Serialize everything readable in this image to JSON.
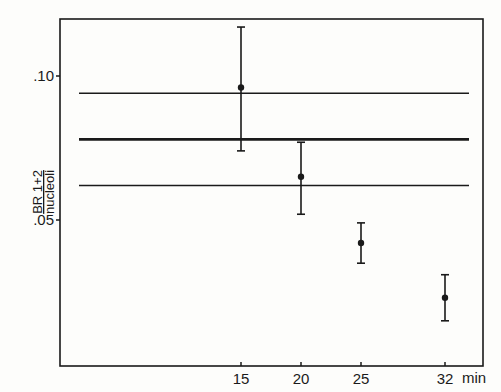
{
  "chart_data": {
    "type": "scatter",
    "title": "",
    "xlabel": "min",
    "ylabel": "BR 1+2 / nucleoli",
    "ylabel_numerator": "BR 1+2",
    "ylabel_denominator": "nucleoli",
    "xlim": [
      0,
      35
    ],
    "ylim": [
      0,
      0.12
    ],
    "grid": false,
    "legend": null,
    "x_ticks": [
      15,
      20,
      25,
      32
    ],
    "x_tick_labels": [
      "15",
      "20",
      "25",
      "32"
    ],
    "y_ticks": [
      0.05,
      0.1
    ],
    "y_tick_labels": [
      ".05",
      ".10"
    ],
    "series": [
      {
        "name": "mean ± error",
        "points": [
          {
            "x": 15,
            "y": 0.096,
            "y_low": 0.074,
            "y_high": 0.117
          },
          {
            "x": 20,
            "y": 0.065,
            "y_low": 0.052,
            "y_high": 0.077
          },
          {
            "x": 25,
            "y": 0.042,
            "y_low": 0.035,
            "y_high": 0.049
          },
          {
            "x": 32,
            "y": 0.023,
            "y_low": 0.015,
            "y_high": 0.031
          }
        ]
      }
    ],
    "reference_lines": [
      {
        "name": "upper-bound",
        "y": 0.094,
        "x_start": 1.5,
        "x_end": 34,
        "style": "thin"
      },
      {
        "name": "mean",
        "y": 0.078,
        "x_start": 1.5,
        "x_end": 34,
        "style": "thick"
      },
      {
        "name": "lower-bound",
        "y": 0.062,
        "x_start": 1.5,
        "x_end": 34,
        "style": "thin"
      }
    ]
  }
}
